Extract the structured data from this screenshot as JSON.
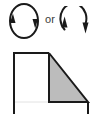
{
  "figure": {
    "name": "rotation-direction-and-shaded-solid-diagram",
    "background_color": "#ffffff",
    "width": 95,
    "height": 114
  },
  "symbols": {
    "connector_label": "or",
    "closed_loop": {
      "icon_name": "clockwise-rotation-closed-circle-icon",
      "description": "closed circular loop with two opposing arrowheads",
      "stroke_color": "#1a1a1a",
      "stroke_width": 2,
      "arrowheads": [
        {
          "name": "left-arrowhead-up",
          "direction": "up",
          "position": "left"
        },
        {
          "name": "right-arrowhead-down",
          "direction": "down",
          "position": "right"
        }
      ]
    },
    "open_loop": {
      "icon_name": "clockwise-rotation-open-arc-icon",
      "description": "open arc with two arrowheads, gap at lower left",
      "stroke_color": "#1a1a1a",
      "stroke_width": 2,
      "arrowheads": [
        {
          "name": "left-arrowhead-up",
          "direction": "up",
          "position": "left"
        },
        {
          "name": "right-arrowhead-down",
          "direction": "down",
          "position": "right"
        }
      ]
    }
  },
  "solid": {
    "name": "rectangle-with-shaded-triangular-face",
    "outline_color": "#1a1a1a",
    "outline_width": 2,
    "white_face_color": "#ffffff",
    "shaded_face_color": "#bcbcbc",
    "faint_line_color": "#e2e2e2",
    "vertices": {
      "top_left": [
        14,
        9
      ],
      "top_mid": [
        49,
        9
      ],
      "bottom_left": [
        14,
        70
      ],
      "bottom_mid": [
        49,
        58
      ],
      "apex_right": [
        88,
        58
      ]
    }
  }
}
